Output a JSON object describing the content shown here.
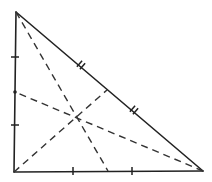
{
  "diagram": {
    "title": "",
    "colors": {
      "stroke": "#222222",
      "background": "#ffffff"
    },
    "vertices": {
      "A": [
        16,
        12
      ],
      "B": [
        14,
        172
      ],
      "C": [
        203,
        171
      ]
    },
    "midpoints": {
      "AB": [
        15,
        92
      ],
      "BC": [
        108,
        171
      ],
      "AC": [
        107,
        90
      ]
    },
    "centroid": [
      77,
      115
    ],
    "sides": [
      {
        "name": "AB",
        "tick_style": "single",
        "ticks": [
          [
            15,
            57
          ],
          [
            15,
            125
          ]
        ]
      },
      {
        "name": "BC",
        "tick_style": "single",
        "ticks": [
          [
            73,
            171
          ],
          [
            132,
            171
          ]
        ]
      },
      {
        "name": "AC",
        "tick_style": "double",
        "ticks": [
          [
            81,
            65
          ],
          [
            134,
            110
          ]
        ]
      }
    ],
    "medians": [
      {
        "from": "A",
        "to": "BC_mid"
      },
      {
        "from": "B",
        "to": "AC_mid"
      },
      {
        "from": "C",
        "to": "AB_mid"
      }
    ]
  }
}
